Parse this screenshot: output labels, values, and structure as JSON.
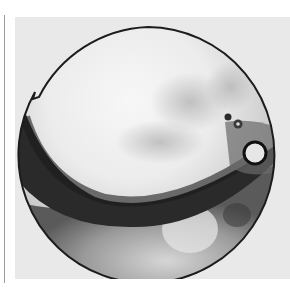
{
  "image": {
    "subject": "round polished metal disc (mirror) photographed in black and white",
    "description": "A circular disc with a bright upper face, a dark crescent band across the lower half, two small rivets and a ring loop at the right edge, and a small notch on the upper-left rim.",
    "colors": {
      "page_background": "#ffffff",
      "photo_background": "#e9e9e9",
      "disc_highlight": "#f4f4f4",
      "disc_dark_band": "#2a2a2a",
      "rim_edge": "#1c1c1c",
      "left_rule": "#9a9a9a"
    },
    "features": [
      "bright reflective upper surface",
      "dark crescent band across lower half",
      "lighter lower-right region",
      "two small rivets near right edge",
      "ring loop attachment at right edge",
      "small notch on upper-left rim"
    ]
  }
}
